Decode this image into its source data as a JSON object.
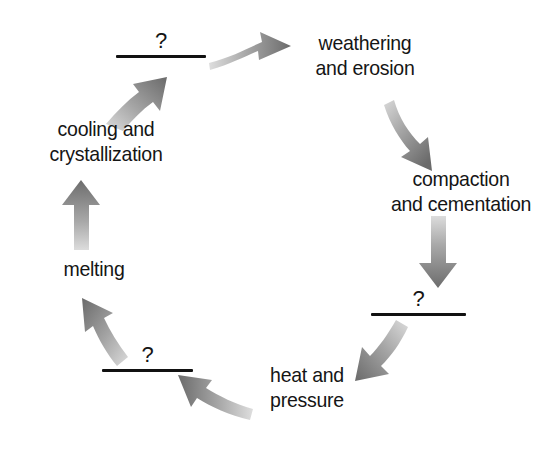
{
  "diagram": {
    "type": "cycle",
    "direction": "clockwise",
    "background_color": "#ffffff",
    "text_color": "#151515",
    "rule_color": "#111111",
    "arrow_color_dark": "#6e6e6e",
    "arrow_color_light": "#d8d8d8",
    "blank_marker": "?",
    "nodes": [
      {
        "id": "blank-top",
        "kind": "blank",
        "marker": "?",
        "lines": [
          "?"
        ]
      },
      {
        "id": "weathering",
        "kind": "label",
        "lines": [
          "weathering",
          "and erosion"
        ]
      },
      {
        "id": "compaction",
        "kind": "label",
        "lines": [
          "compaction",
          "and cementation"
        ]
      },
      {
        "id": "blank-right",
        "kind": "blank",
        "marker": "?",
        "lines": [
          "?"
        ]
      },
      {
        "id": "heat-pressure",
        "kind": "label",
        "lines": [
          "heat and",
          "pressure"
        ]
      },
      {
        "id": "blank-bottom",
        "kind": "blank",
        "marker": "?",
        "lines": [
          "?"
        ]
      },
      {
        "id": "melting",
        "kind": "label",
        "lines": [
          "melting"
        ]
      },
      {
        "id": "cooling",
        "kind": "label",
        "lines": [
          "cooling and",
          "crystallization"
        ]
      }
    ],
    "edges": [
      {
        "id": "arrow-blanktop-to-weathering",
        "from": "blank-top",
        "to": "weathering",
        "shape": "curved",
        "heading": "right"
      },
      {
        "id": "arrow-weathering-to-compaction",
        "from": "weathering",
        "to": "compaction",
        "shape": "curved",
        "heading": "down-right"
      },
      {
        "id": "arrow-compaction-to-blankright",
        "from": "compaction",
        "to": "blank-right",
        "shape": "straight",
        "heading": "down"
      },
      {
        "id": "arrow-blankright-to-heat",
        "from": "blank-right",
        "to": "heat-pressure",
        "shape": "curved",
        "heading": "down-left"
      },
      {
        "id": "arrow-heat-to-blankbottom",
        "from": "heat-pressure",
        "to": "blank-bottom",
        "shape": "curved",
        "heading": "left"
      },
      {
        "id": "arrow-blankbottom-to-melting",
        "from": "blank-bottom",
        "to": "melting",
        "shape": "curved",
        "heading": "up-left"
      },
      {
        "id": "arrow-melting-to-cooling",
        "from": "melting",
        "to": "cooling",
        "shape": "straight",
        "heading": "up"
      },
      {
        "id": "arrow-cooling-to-blanktop",
        "from": "cooling",
        "to": "blank-top",
        "shape": "curved",
        "heading": "up-right"
      }
    ]
  }
}
